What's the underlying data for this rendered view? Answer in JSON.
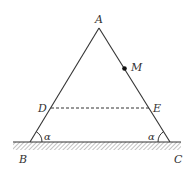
{
  "diagram": {
    "points": {
      "A": "A",
      "B": "B",
      "C": "C",
      "D": "D",
      "E": "E",
      "M": "M"
    },
    "angles": {
      "left": "α",
      "right": "α"
    },
    "colors": {
      "line": "#333333",
      "hatch": "#888888"
    }
  }
}
